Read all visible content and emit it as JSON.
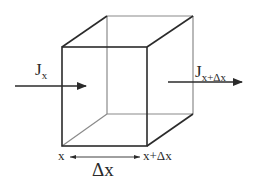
{
  "diagram": {
    "type": "control-volume-cube",
    "colors": {
      "front_edges": "#2b2b2b",
      "back_edges": "#8a8a8a",
      "text": "#2a2a2a"
    },
    "cube": {
      "front_face": {
        "x1": 62,
        "y1": 47,
        "x2": 147,
        "y2": 146
      },
      "back_face": {
        "x1": 107,
        "y1": 16,
        "x2": 193,
        "y2": 114
      }
    },
    "labels": {
      "flux_in_main": "J",
      "flux_in_sub": "x",
      "flux_out_main": "J",
      "flux_out_sub": "x+Δx",
      "position_left": "x",
      "position_right": "x+Δx",
      "width": "Δx"
    },
    "arrows": {
      "flux_in": {
        "x1": 15,
        "y1": 86,
        "x2": 86,
        "y2": 86
      },
      "flux_out": {
        "x1": 168,
        "y1": 82,
        "x2": 242,
        "y2": 82
      },
      "dimension": {
        "x1": 70,
        "y1": 157,
        "x2": 140,
        "y2": 157
      }
    }
  }
}
